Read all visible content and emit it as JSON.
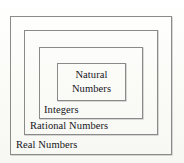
{
  "diagram": {
    "type": "nested-set-venn",
    "background_color": "#fcfcfa",
    "border_color": "#8a8a8a",
    "text_color": "#15151a",
    "sets": [
      {
        "id": "real",
        "label": "Real Numbers",
        "level": 1,
        "label_position": "bottom-left"
      },
      {
        "id": "rational",
        "label": "Rational Numbers",
        "level": 2,
        "label_position": "bottom-left"
      },
      {
        "id": "integers",
        "label": "Integers",
        "level": 3,
        "label_position": "bottom-left"
      },
      {
        "id": "natural",
        "label": "Natural Numbers",
        "label_line_1": "Natural",
        "label_line_2": "Numbers",
        "level": 4,
        "label_position": "center"
      }
    ]
  }
}
